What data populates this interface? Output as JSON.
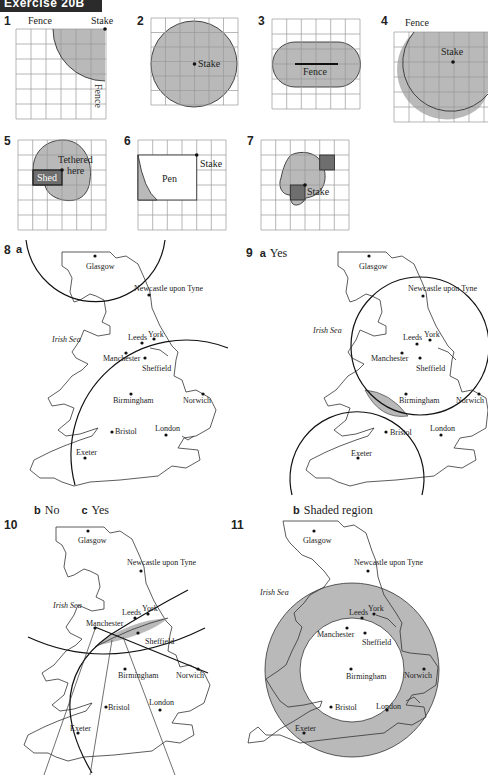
{
  "header": {
    "title": "Exercise 20B"
  },
  "exercises": [
    {
      "number": "1",
      "labels": [
        "Fence",
        "Stake",
        "Fence"
      ]
    },
    {
      "number": "2",
      "labels": [
        "Stake"
      ]
    },
    {
      "number": "3",
      "labels": [
        "Fence"
      ]
    },
    {
      "number": "4",
      "labels": [
        "Fence",
        "Stake"
      ]
    },
    {
      "number": "5",
      "labels": [
        "Tethered",
        "here",
        "Shed"
      ]
    },
    {
      "number": "6",
      "labels": [
        "Pen",
        "Stake"
      ]
    },
    {
      "number": "7",
      "labels": [
        "Stake"
      ]
    },
    {
      "number": "8",
      "part_a": "a",
      "part_b": "b",
      "answer_b": "No",
      "part_c": "c",
      "answer_c": "Yes"
    },
    {
      "number": "9",
      "part_a": "a",
      "answer_a": "Yes",
      "part_b": "b",
      "answer_b": "Shaded region"
    },
    {
      "number": "10"
    },
    {
      "number": "11"
    }
  ],
  "map": {
    "sea_label": "Irish Sea",
    "cities": {
      "glasgow": "Glasgow",
      "newcastle": "Newcastle upon Tyne",
      "leeds": "Leeds",
      "york": "York",
      "manchester": "Manchester",
      "sheffield": "Sheffield",
      "birmingham": "Birmingham",
      "norwich": "Norwich",
      "bristol": "Bristol",
      "london": "London",
      "exeter": "Exeter"
    }
  },
  "colors": {
    "shade": "#b9b9b9",
    "dark_shade": "#6e6e6e",
    "banner": "#2b2b2b",
    "grid": "#999999"
  }
}
